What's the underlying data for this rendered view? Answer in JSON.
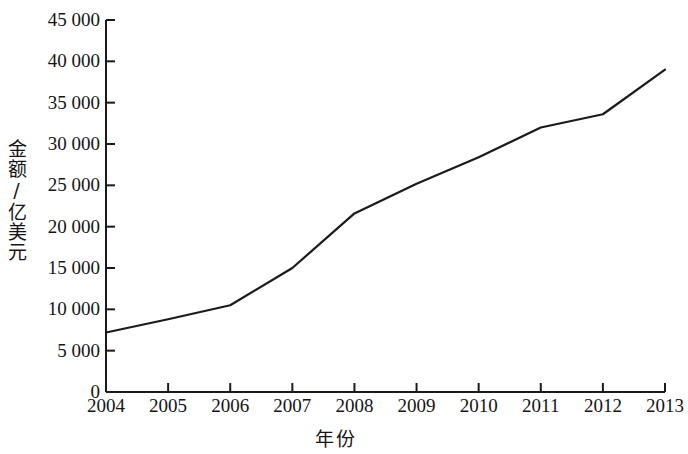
{
  "chart_data": {
    "type": "line",
    "title": "",
    "xlabel": "年份",
    "ylabel": "金额/亿美元",
    "x": [
      "2004",
      "2005",
      "2006",
      "2007",
      "2008",
      "2009",
      "2010",
      "2011",
      "2012",
      "2013"
    ],
    "categories": [
      "2004",
      "2005",
      "2006",
      "2007",
      "2008",
      "2009",
      "2010",
      "2011",
      "2012",
      "2013"
    ],
    "values": [
      7200,
      8800,
      10500,
      15000,
      21600,
      25200,
      28400,
      32000,
      33600,
      39000
    ],
    "series": [
      {
        "name": "金额",
        "values": [
          7200,
          8800,
          10500,
          15000,
          21600,
          25200,
          28400,
          32000,
          33600,
          39000
        ]
      }
    ],
    "ylim": [
      0,
      45000
    ],
    "yticks": [
      0,
      5000,
      10000,
      15000,
      20000,
      25000,
      30000,
      35000,
      40000,
      45000
    ],
    "ytick_labels": [
      "0",
      "5 000",
      "10 000",
      "15 000",
      "20 000",
      "25 000",
      "30 000",
      "35 000",
      "40 000",
      "45 000"
    ],
    "xtick_labels": [
      "2004",
      "2005",
      "2006",
      "2007",
      "2008",
      "2009",
      "2010",
      "2011",
      "2012",
      "2013"
    ],
    "grid": false,
    "legend": "none",
    "line_color": "#1a1a1a",
    "axis_color": "#1a1a1a",
    "background_color": "#ffffff"
  }
}
